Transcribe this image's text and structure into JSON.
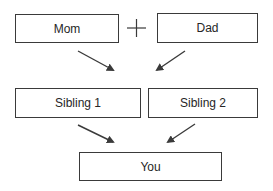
{
  "diagram": {
    "nodes": [
      {
        "id": "mom",
        "label": "Mom"
      },
      {
        "id": "dad",
        "label": "Dad"
      },
      {
        "id": "sibling1",
        "label": "Sibling 1"
      },
      {
        "id": "sibling2",
        "label": "Sibling 2"
      },
      {
        "id": "you",
        "label": "You"
      }
    ],
    "operator": "+",
    "edges": [
      {
        "from": "mom",
        "to": "siblings"
      },
      {
        "from": "dad",
        "to": "siblings"
      },
      {
        "from": "sibling1",
        "to": "you"
      },
      {
        "from": "sibling2",
        "to": "you"
      }
    ],
    "colors": {
      "stroke": "#3a3a3a",
      "text": "#262626",
      "background": "#ffffff"
    }
  }
}
